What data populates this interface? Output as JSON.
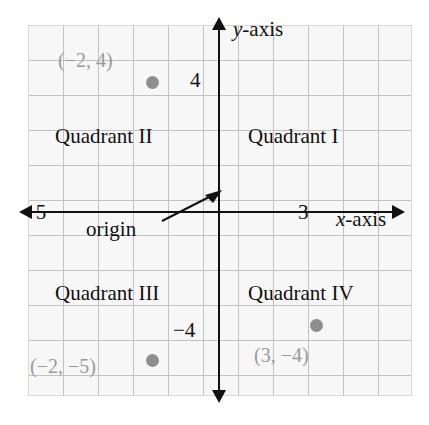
{
  "figure": {
    "type": "coordinate-plane",
    "axes": {
      "x_label_var": "x",
      "x_label_suffix": "-axis",
      "y_label_var": "y",
      "y_label_suffix": "-axis",
      "origin_label": "origin"
    },
    "ticks": {
      "y_positive": "4",
      "y_negative": "−4",
      "x_negative": "−5",
      "x_positive": "3"
    },
    "quadrants": [
      {
        "id": "q1",
        "label": "Quadrant I"
      },
      {
        "id": "q2",
        "label": "Quadrant II"
      },
      {
        "id": "q3",
        "label": "Quadrant III"
      },
      {
        "id": "q4",
        "label": "Quadrant IV"
      }
    ],
    "points": [
      {
        "id": "a",
        "label": "(−2, 4)",
        "x": -2,
        "y": 4
      },
      {
        "id": "b",
        "label": "(−2, −5)",
        "x": -2,
        "y": -5
      },
      {
        "id": "c",
        "label": "(3, −4)",
        "x": 3,
        "y": -4
      }
    ],
    "colors": {
      "axis": "#111111",
      "grid_line": "#c2c2c2",
      "grid_fill": "#f7f7f7",
      "point": "#8e8e8e",
      "point_label": "#9a9a9a",
      "text": "#111111"
    }
  }
}
